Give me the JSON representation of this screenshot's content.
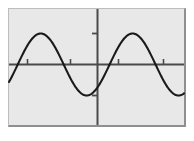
{
  "figure": {
    "background_color": "#ffffff",
    "plot_background_color": "#e8e8e8",
    "plot_border_color": "#8f8f8f",
    "axis_color": "#4a4a4a",
    "curve_color": "#1a1a1a",
    "title": "",
    "caption": ""
  },
  "chart_data": {
    "type": "line",
    "title": "",
    "subtitle": "",
    "xlabel": "",
    "ylabel": "",
    "legend": [],
    "legend_position": "none",
    "grid": false,
    "axes": {
      "x_axis_visible": true,
      "y_axis_visible": true,
      "x_axis_y_value": 0,
      "y_axis_x_value": 0,
      "xlim": [
        -2.3,
        1.7
      ],
      "ylim": [
        -1.45,
        1.45
      ],
      "x_ticks": [
        -1.75,
        -0.75,
        0.35,
        1.35
      ],
      "x_tick_labels": [
        "",
        "",
        "",
        ""
      ],
      "y_ticks": [
        -1,
        1
      ],
      "y_tick_labels": [
        "",
        ""
      ]
    },
    "annotations": [],
    "series": [
      {
        "name": "sine",
        "function": "y = sin(x)",
        "amplitude": 1,
        "period": 2.1,
        "phase": 0,
        "color": "#1a1a1a",
        "line_width": 2,
        "x": [
          -2.3,
          -2.1,
          -1.9,
          -1.7,
          -1.5,
          -1.3,
          -1.1,
          -0.9,
          -0.7,
          -0.5,
          -0.3,
          -0.1,
          0.1,
          0.3,
          0.5,
          0.7,
          0.9,
          1.1,
          1.3,
          1.5,
          1.7
        ],
        "y": [
          0,
          0.559,
          0.905,
          1.0,
          0.827,
          0.434,
          -0.072,
          -0.545,
          -0.895,
          -1.0,
          -0.841,
          -0.462,
          0.038,
          0.519,
          0.882,
          1.0,
          0.854,
          0.486,
          -0.01,
          -0.496,
          -0.868
        ]
      }
    ]
  }
}
